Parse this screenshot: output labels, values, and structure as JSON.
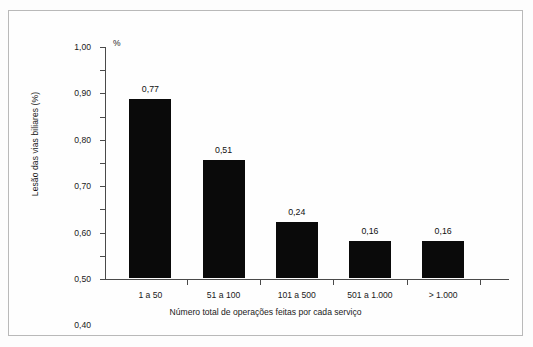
{
  "chart_data": {
    "type": "bar",
    "title": "",
    "categories": [
      "1 a 50",
      "51 a 100",
      "101 a 500",
      "501 a 1.000",
      "> 1.000"
    ],
    "values": [
      0.77,
      0.51,
      0.24,
      0.16,
      0.16
    ],
    "value_labels": [
      "0,77",
      "0,51",
      "0,24",
      "0,16",
      "0,16"
    ],
    "xlabel": "Número total de operações feitas por cada serviço",
    "ylabel": "Lesão das vias biliares (%)",
    "unit_marker": "%",
    "ylim": [
      0,
      1
    ],
    "ytick_step": 0.1,
    "ytick_labels": [
      "0,00",
      "0,10",
      "0,20",
      "0,30",
      "0,40",
      "0,50",
      "0,60",
      "0,70",
      "0,80",
      "0,90",
      "1,00"
    ],
    "ytick_values": [
      0,
      0.1,
      0.2,
      0.3,
      0.4,
      0.5,
      0.6,
      0.7,
      0.8,
      0.9,
      1.0
    ],
    "grid": false,
    "legend": false,
    "bar_color": "#0a0a0a",
    "axis_color": "#4a4a4a",
    "frame_color": "#b9b9b9",
    "background": "#fefefe"
  }
}
